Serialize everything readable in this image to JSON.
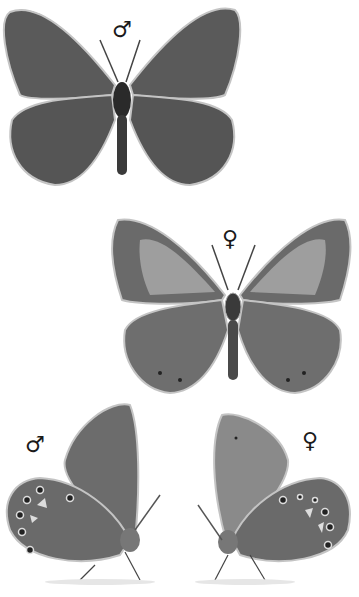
{
  "plate": {
    "figures": [
      {
        "id": "male-upperside",
        "view": "upperside",
        "sex_symbol": "♂"
      },
      {
        "id": "female-upperside",
        "view": "upperside",
        "sex_symbol": "♀"
      },
      {
        "id": "male-underside",
        "view": "underside",
        "sex_symbol": "♂"
      },
      {
        "id": "female-underside",
        "view": "underside",
        "sex_symbol": "♀"
      }
    ],
    "colors": {
      "background": "#ffffff",
      "male_wing": "#5a5a5a",
      "female_wing_dark": "#6a6a6a",
      "female_wing_light": "#9a9a9a",
      "underside_wing": "#7a7a7a",
      "fringe": "#bdbdbd",
      "body": "#333333"
    }
  }
}
